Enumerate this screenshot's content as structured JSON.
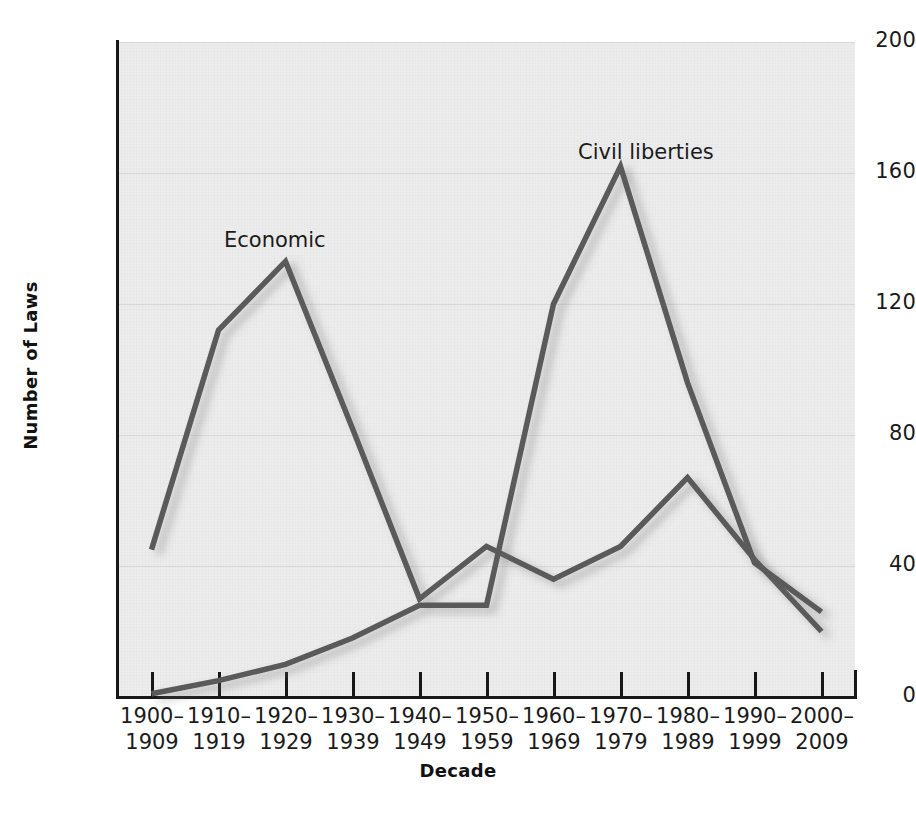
{
  "chart_data": {
    "type": "line",
    "title": "",
    "xlabel": "Decade",
    "ylabel": "Number of Laws",
    "categories": [
      "1900–\n1909",
      "1910–\n1919",
      "1920–\n1929",
      "1930–\n1939",
      "1940–\n1949",
      "1950–\n1959",
      "1960–\n1969",
      "1970–\n1979",
      "1980–\n1989",
      "1990–\n1999",
      "2000–\n2009"
    ],
    "series": [
      {
        "name": "Economic",
        "color": "#5a5a5a",
        "values": [
          45,
          112,
          133,
          82,
          30,
          46,
          36,
          46,
          67,
          42,
          20
        ]
      },
      {
        "name": "Civil liberties",
        "color": "#5a5a5a",
        "values": [
          1,
          5,
          10,
          18,
          28,
          28,
          120,
          162,
          96,
          41,
          26
        ]
      }
    ],
    "ylim": [
      0,
      200
    ],
    "yticks": [
      0,
      40,
      80,
      120,
      160,
      200
    ],
    "ytick_labels": [
      "0",
      "40",
      "80",
      "120",
      "160",
      "200"
    ],
    "grid": true,
    "legend_position": "inline-annotations",
    "annotations": [
      {
        "text": "Economic",
        "x_category": "1920–\n1929",
        "value": 133
      },
      {
        "text": "Civil liberties",
        "x_category": "1970–\n1979",
        "value": 162
      }
    ],
    "plot_background": "#ececec",
    "axis_color": "#171717",
    "gridline_color": "#d8d8d8"
  }
}
